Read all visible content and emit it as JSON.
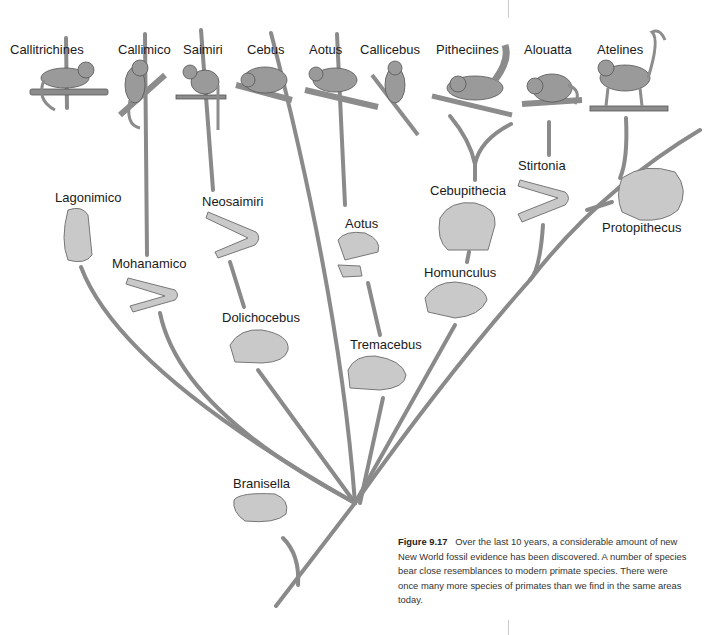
{
  "living_taxa": [
    {
      "label": "Callitrichines",
      "x": 10,
      "y": 44
    },
    {
      "label": "Callimico",
      "x": 118,
      "y": 44
    },
    {
      "label": "Saimiri",
      "x": 183,
      "y": 44
    },
    {
      "label": "Cebus",
      "x": 247,
      "y": 44
    },
    {
      "label": "Aotus",
      "x": 309,
      "y": 44
    },
    {
      "label": "Callicebus",
      "x": 360,
      "y": 44
    },
    {
      "label": "Pitheciines",
      "x": 436,
      "y": 44
    },
    {
      "label": "Alouatta",
      "x": 524,
      "y": 44
    },
    {
      "label": "Atelines",
      "x": 597,
      "y": 44
    }
  ],
  "fossil_taxa": [
    {
      "label": "Lagonimico",
      "x": 55,
      "y": 192
    },
    {
      "label": "Neosaimiri",
      "x": 202,
      "y": 196
    },
    {
      "label": "Mohanamico",
      "x": 112,
      "y": 258
    },
    {
      "label": "Dolichocebus",
      "x": 222,
      "y": 312
    },
    {
      "label": "Aotus",
      "x": 345,
      "y": 218
    },
    {
      "label": "Tremacebus",
      "x": 350,
      "y": 339
    },
    {
      "label": "Cebupithecia",
      "x": 430,
      "y": 185
    },
    {
      "label": "Homunculus",
      "x": 424,
      "y": 267
    },
    {
      "label": "Stirtonia",
      "x": 518,
      "y": 160
    },
    {
      "label": "Protopithecus",
      "x": 602,
      "y": 222
    },
    {
      "label": "Branisella",
      "x": 233,
      "y": 478
    }
  ],
  "caption": {
    "figure_label": "Figure 9.17",
    "text": "Over the last 10 years, a considerable amount of new New World fossil evidence has been discovered. A number of species bear close resemblances to modern primate species. There were once many more species of primates than we find in the same areas today."
  },
  "colors": {
    "branch": "#8a8a8a",
    "illustration": "#9a9a9a",
    "text": "#1a1a1a"
  }
}
